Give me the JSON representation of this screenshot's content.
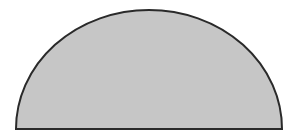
{
  "diagram": {
    "shape": "semicircle",
    "fill_color": "#c6c6c6",
    "stroke_color": "#2a2a2a",
    "background_color": "#ffffff",
    "geometry": {
      "left_x": 16,
      "right_x": 282,
      "base_y": 129,
      "top_y": 10
    }
  }
}
